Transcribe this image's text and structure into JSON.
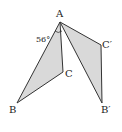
{
  "diagram": {
    "type": "geometry-rotation",
    "points": {
      "A": {
        "label": "A",
        "x": 60,
        "y": 22
      },
      "B": {
        "label": "B",
        "x": 17,
        "y": 103
      },
      "C": {
        "label": "C",
        "x": 63,
        "y": 72
      },
      "C_prime": {
        "label": "C′",
        "x": 101,
        "y": 45
      },
      "B_prime": {
        "label": "B′",
        "x": 102,
        "y": 103
      }
    },
    "triangles": [
      {
        "name": "ABC",
        "vertices": [
          "A",
          "B",
          "C"
        ]
      },
      {
        "name": "AB′C′",
        "vertices": [
          "A",
          "B′",
          "C′"
        ]
      }
    ],
    "angle_annotation": {
      "value": "56°",
      "at": "A"
    },
    "colors": {
      "fill": "#d9d9d9",
      "stroke": "#333333",
      "background": "#ffffff"
    }
  }
}
